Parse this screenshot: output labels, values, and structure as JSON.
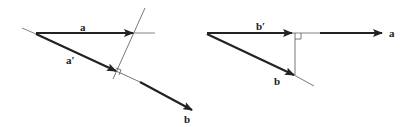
{
  "figure": {
    "left_panel": {
      "labels": {
        "vector_a": "a",
        "projection_a_prime": "a′",
        "vector_b": "b"
      }
    },
    "right_panel": {
      "labels": {
        "projection_b_prime": "b′",
        "vector_b": "b",
        "vector_a": "a"
      }
    },
    "colors": {
      "vector": "#222222",
      "guide": "#555555"
    }
  }
}
